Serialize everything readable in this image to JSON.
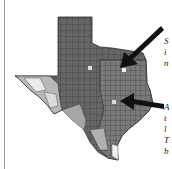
{
  "figure": {
    "type": "choropleth map",
    "region": "Texas counties",
    "colors": {
      "dark": "#5c5c5c",
      "medium_dark": "#777777",
      "medium": "#999999",
      "light": "#c4c4c4",
      "lightest": "#ececec",
      "border": "#2a2a2a",
      "arrow": "#111111"
    }
  },
  "annotations": [
    {
      "id": "top",
      "lines": [
        "S",
        "i",
        "n"
      ]
    },
    {
      "id": "bottom",
      "lines": [
        "A",
        "t",
        "l",
        "T",
        "b"
      ]
    }
  ]
}
